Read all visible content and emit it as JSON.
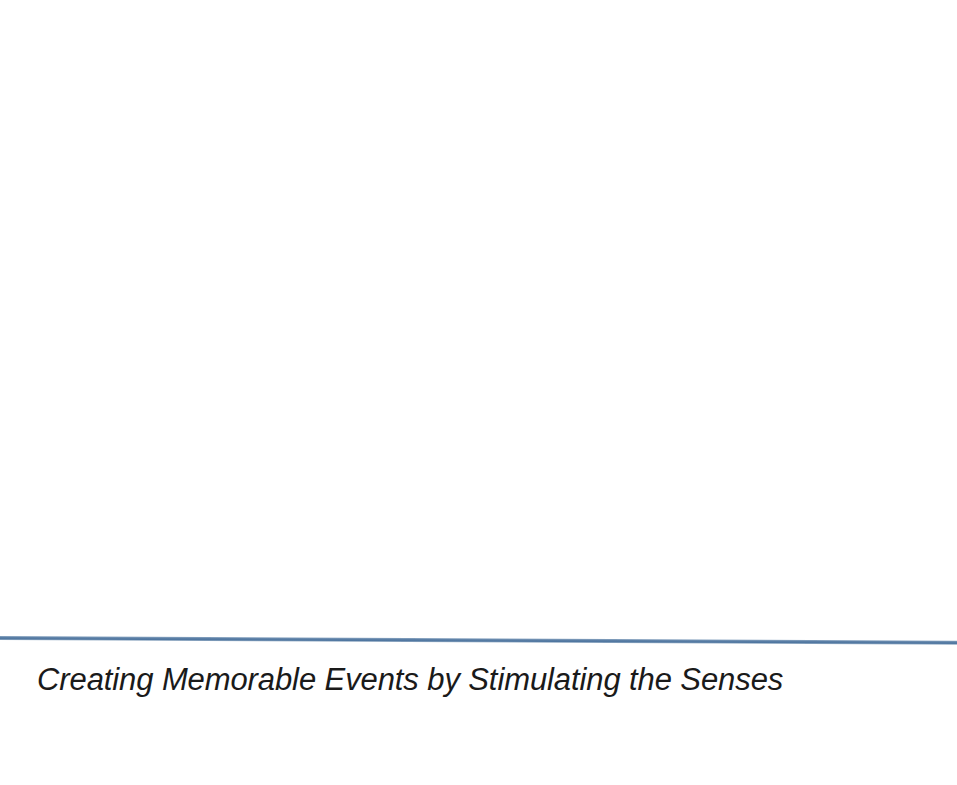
{
  "slide": {
    "background_color": "#ffffff",
    "width": 957,
    "height": 785,
    "content_area": {
      "text": ""
    },
    "divider": {
      "color": "#5b7fa6",
      "name": "horizontal-rule"
    },
    "footer": {
      "text": "Creating Memorable Events by Stimulating the Senses",
      "color": "#1a1a1a",
      "style": "italic"
    }
  }
}
